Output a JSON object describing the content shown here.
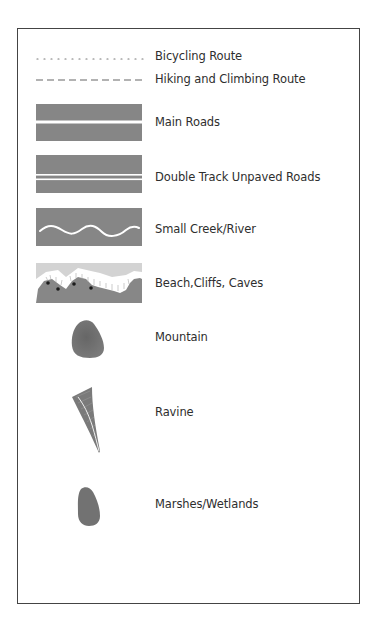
{
  "legend": {
    "items": [
      {
        "id": "bicycling-route",
        "label": "Bicycling Route",
        "symbol": "dotted-line"
      },
      {
        "id": "hiking-climbing-route",
        "label": "Hiking and Climbing Route",
        "symbol": "dashed-line"
      },
      {
        "id": "main-roads",
        "label": "Main Roads",
        "symbol": "road-single-line"
      },
      {
        "id": "double-track-unpaved-roads",
        "label": "Double Track Unpaved Roads",
        "symbol": "road-double-line"
      },
      {
        "id": "small-creek-river",
        "label": "Small Creek/River",
        "symbol": "wavy-river"
      },
      {
        "id": "beach-cliffs-caves",
        "label": "Beach,Cliffs, Caves",
        "symbol": "coastline-cliffs"
      },
      {
        "id": "mountain",
        "label": "Mountain",
        "symbol": "mountain-blob"
      },
      {
        "id": "ravine",
        "label": "Ravine",
        "symbol": "ravine-wedge"
      },
      {
        "id": "marshes-wetlands",
        "label": "Marshes/Wetlands",
        "symbol": "marsh-blob"
      }
    ]
  },
  "colors": {
    "symbol_fill": "#858585",
    "symbol_dark": "#6b6b6b",
    "sand": "#cfcfcf",
    "border": "#444444",
    "text": "#2e2e2e"
  }
}
